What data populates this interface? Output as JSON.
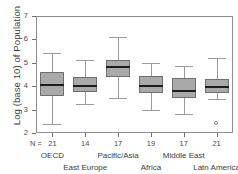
{
  "chart_data": {
    "type": "box",
    "title": "",
    "xlabel": "",
    "ylabel": "Log (base 10) of Population",
    "ylim": [
      2,
      7
    ],
    "ytick_labels": [
      "7",
      "6",
      "5",
      "4",
      "3",
      "2"
    ],
    "grid": false,
    "legend": "none",
    "n_prefix": "N =",
    "categories": [
      "OECD",
      "East Europe",
      "Pacific/Asia",
      "Africa",
      "Middle East",
      "Latn America"
    ],
    "counts": [
      21,
      14,
      17,
      19,
      17,
      21
    ],
    "series": [
      {
        "name": "OECD",
        "n": 21,
        "whisker_low": 2.4,
        "q1": 3.6,
        "median": 4.05,
        "q3": 4.6,
        "whisker_high": 5.4,
        "outliers": []
      },
      {
        "name": "East Europe",
        "n": 14,
        "whisker_low": 3.25,
        "q1": 3.75,
        "median": 4.0,
        "q3": 4.4,
        "whisker_high": 5.1,
        "outliers": []
      },
      {
        "name": "Pacific/Asia",
        "n": 17,
        "whisker_low": 3.5,
        "q1": 4.4,
        "median": 4.8,
        "q3": 5.1,
        "whisker_high": 6.1,
        "outliers": []
      },
      {
        "name": "Africa",
        "n": 19,
        "whisker_low": 3.0,
        "q1": 3.7,
        "median": 4.0,
        "q3": 4.45,
        "whisker_high": 5.0,
        "outliers": []
      },
      {
        "name": "Middle East",
        "n": 17,
        "whisker_low": 2.8,
        "q1": 3.5,
        "median": 3.8,
        "q3": 4.35,
        "whisker_high": 4.85,
        "outliers": []
      },
      {
        "name": "Latn America",
        "n": 21,
        "whisker_low": 3.45,
        "q1": 3.7,
        "median": 3.95,
        "q3": 4.3,
        "whisker_high": 5.2,
        "outliers": [
          2.4
        ]
      }
    ],
    "colors": {
      "box_fill": "#a9a9a9",
      "box_border": "#6f6f6f",
      "median": "#1c1c1c",
      "whisker": "#9a9a9a",
      "axis": "#8d8d8d",
      "text": "#3b3b3b",
      "background": "#ffffff"
    }
  }
}
